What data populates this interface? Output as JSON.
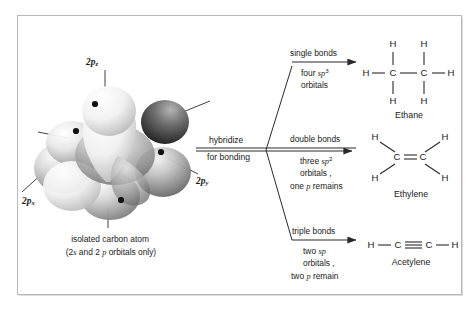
{
  "figure": {
    "border_color": "#b9b9b9",
    "background": "#ffffff",
    "ink_color": "#1a1a1a"
  },
  "orbital_model": {
    "name": "isolated carbon atom orbital model",
    "labels": [
      {
        "id": "2pz",
        "base": "2p",
        "sub": "z",
        "position": "top"
      },
      {
        "id": "2px",
        "base": "2p",
        "sub": "x",
        "position": "bottom-left"
      },
      {
        "id": "2py",
        "base": "2p",
        "sub": "y",
        "position": "right"
      }
    ],
    "caption_line1": "isolated carbon atom",
    "caption_line2_prefix": "(2",
    "caption_line2_s": "s",
    "caption_line2_mid": " and 2 ",
    "caption_line2_p": "p",
    "caption_line2_suffix": " orbitals only)",
    "electron_dot_count": 4
  },
  "hybridize_arrow": {
    "above_label": "hybridize",
    "below_label": "for bonding"
  },
  "branches": [
    {
      "id": "single",
      "heading": "single bonds",
      "line2_pre": "four ",
      "line2_orb": "sp",
      "line2_sup": "3",
      "line3": "orbitals",
      "line4": "",
      "line4_italic": "",
      "line4_post": "",
      "molecule": {
        "name": "Ethane",
        "formula_atoms": [
          "H",
          "H",
          "H",
          "C",
          "C",
          "H",
          "H",
          "H"
        ],
        "bond_type": "single"
      }
    },
    {
      "id": "double",
      "heading": "double bonds",
      "line2_pre": "three  ",
      "line2_orb": "sp",
      "line2_sup": "2",
      "line3": "orbitals ,",
      "line4": "one ",
      "line4_italic": "p",
      "line4_post": " remains",
      "molecule": {
        "name": "Ethylene",
        "formula_atoms": [
          "H",
          "H",
          "C",
          "C",
          "H",
          "H"
        ],
        "bond_type": "double"
      }
    },
    {
      "id": "triple",
      "heading": "triple bonds",
      "line2_pre": "two ",
      "line2_orb": "sp",
      "line2_sup": "",
      "line3": "orbitals ,",
      "line4": "two ",
      "line4_italic": "p",
      "line4_post": " remain",
      "molecule": {
        "name": "Acetylene",
        "formula_atoms": [
          "H",
          "C",
          "C",
          "H"
        ],
        "bond_type": "triple"
      }
    }
  ],
  "molecules": {
    "ethane": {
      "name": "Ethane",
      "h_top_left": "H",
      "h_top_right": "H",
      "h_left": "H",
      "h_right": "H",
      "c_left": "C",
      "c_right": "C",
      "h_bot_left": "H",
      "h_bot_right": "H"
    },
    "ethylene": {
      "name": "Ethylene",
      "h_tl": "H",
      "h_tr": "H",
      "h_bl": "H",
      "h_br": "H",
      "c_left": "C",
      "c_right": "C"
    },
    "acetylene": {
      "name": "Acetylene",
      "h_left": "H",
      "h_right": "H",
      "c_left": "C",
      "c_right": "C"
    }
  }
}
